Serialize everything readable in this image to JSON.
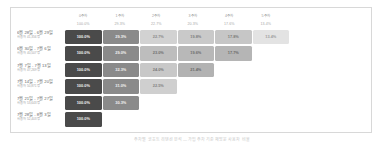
{
  "chart_data": {
    "type": "heatmap",
    "title": "",
    "xlabel": "",
    "ylabel": "",
    "legend_position": "none",
    "grid": false,
    "categories": [
      "0주차",
      "1주차",
      "2주차",
      "3주차",
      "4주차",
      "5주차"
    ],
    "summary_label": "",
    "summary_values": [
      "100.0%",
      "29.3%",
      "22.7%",
      "20.3%",
      "17.6%",
      "13.4%"
    ],
    "cohorts": [
      {
        "label": "6월 28일 - 6월 29일",
        "sub": "사용자 41,356명",
        "values": [
          "100.0%",
          "29.3%",
          "22.7%",
          "19.8%",
          "17.8%",
          "13.4%"
        ]
      },
      {
        "label": "6월 30일 - 7월 6일",
        "sub": "사용자 40,507명",
        "values": [
          "100.0%",
          "29.0%",
          "23.0%",
          "19.6%",
          "17.7%"
        ]
      },
      {
        "label": "7월 7일 - 7월 13일",
        "sub": "사용자 47,269명",
        "values": [
          "100.0%",
          "32.3%",
          "24.0%",
          "21.4%"
        ]
      },
      {
        "label": "7월 14일 - 7월 20일",
        "sub": "사용자 50,871명",
        "values": [
          "100.0%",
          "31.0%",
          "22.5%"
        ]
      },
      {
        "label": "7월 21일 - 7월 27일",
        "sub": "사용자 53,643명",
        "values": [
          "100.0%",
          "30.3%"
        ]
      },
      {
        "label": "7월 28일 - 8월 3일",
        "sub": "사용자 52,403명",
        "values": [
          "100.0%"
        ]
      }
    ],
    "cell_colors": [
      [
        "#4a4a4a",
        "#8a8a8a",
        "#d2d2d2",
        "#c9c9c9",
        "#c6c6c6",
        "#e3e3e3"
      ],
      [
        "#4a4a4a",
        "#8a8a8a",
        "#bdbdbd",
        "#b8b8b8",
        "#b5b5b5"
      ],
      [
        "#4a4a4a",
        "#8a8a8a",
        "#c8c8c8",
        "#b2b2b2"
      ],
      [
        "#4a4a4a",
        "#8a8a8a",
        "#cfcfcf"
      ],
      [
        "#4a4a4a",
        "#8a8a8a"
      ],
      [
        "#4a4a4a"
      ]
    ],
    "cell_text_colors": [
      [
        "#f2f2f2",
        "#f2f2f2",
        "#8a8a8a",
        "#7d7d7d",
        "#7a7a7a",
        "#9e9e9e"
      ],
      [
        "#f2f2f2",
        "#f2f2f2",
        "#6f6f6f",
        "#6c6c6c",
        "#6a6a6a"
      ],
      [
        "#f2f2f2",
        "#f2f2f2",
        "#777777",
        "#686868"
      ],
      [
        "#f2f2f2",
        "#f2f2f2",
        "#838383"
      ],
      [
        "#f2f2f2",
        "#f2f2f2"
      ],
      [
        "#f2f2f2"
      ]
    ]
  },
  "caption": {
    "text": "주차별 코호트 리텐션 분석 — 가입 주차 기준 재방문 사용자 비율"
  },
  "colors": {
    "panel_border": "#d8d8d8",
    "background": "#ffffff",
    "header_text": "#9a9a9a",
    "label_text": "#6a6a6a",
    "sub_text": "#a5a5a5",
    "caption_text": "#c6c6c6"
  }
}
